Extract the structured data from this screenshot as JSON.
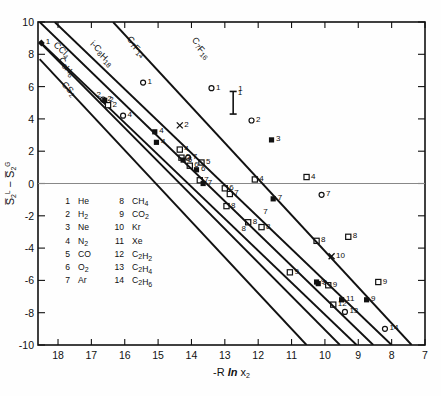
{
  "chart_data": {
    "type": "line",
    "title": "",
    "xlabel": "-R ln x₂",
    "ylabel": "S̅₂ᴸ - S̅₂ᴳ",
    "xlim": [
      18.6,
      7.0
    ],
    "ylim": [
      -10,
      10
    ],
    "x_ticks": [
      18,
      17,
      16,
      15,
      14,
      13,
      12,
      11,
      10,
      9,
      8,
      7
    ],
    "y_ticks": [
      10,
      8,
      6,
      4,
      2,
      0,
      -2,
      -4,
      -6,
      -8,
      -10
    ],
    "grid": false,
    "legend_position": "inside-lower-left",
    "x_axis_reversed": true,
    "zero_line": true,
    "series": [
      {
        "name": "CS2",
        "label": "CS₂",
        "label_x": 17.9,
        "label_y": 6.1,
        "x_start": 18.55,
        "y_start": 7.7,
        "x_end": 10.55,
        "y_end": -10.0,
        "points": [
          {
            "id": "4",
            "x": 16.05,
            "y": 4.2,
            "marker": "open-circle"
          },
          {
            "id": "7",
            "x": 14.1,
            "y": 1.6,
            "marker": "open-circle"
          },
          {
            "id": "8",
            "x": 12.95,
            "y": -1.4,
            "marker": "open-square"
          },
          {
            "id": "9",
            "x": 11.05,
            "y": -5.5,
            "marker": "open-square"
          }
        ]
      },
      {
        "name": "C6H6",
        "label": "C₆H₆",
        "label_x": 18.0,
        "label_y": 7.6,
        "x_start": 18.55,
        "y_start": 8.75,
        "x_end": 9.55,
        "y_end": -10.0,
        "points": [
          {
            "id": "2",
            "x": 16.65,
            "y": 5.2,
            "marker": "open-circle"
          },
          {
            "id": "4",
            "x": 15.1,
            "y": 3.2,
            "marker": "filled-square"
          },
          {
            "id": "5",
            "x": 14.3,
            "y": 1.6,
            "marker": "open-square"
          },
          {
            "id": "6",
            "x": 14.05,
            "y": 1.1,
            "marker": "open-square"
          },
          {
            "id": "7",
            "x": 13.75,
            "y": 0.2,
            "marker": "open-square"
          },
          {
            "id": "8",
            "x": 12.3,
            "y": -2.4,
            "marker": "open-square"
          },
          {
            "id": "9",
            "x": 10.25,
            "y": -6.1,
            "marker": "filled-square"
          }
        ]
      },
      {
        "name": "CCl4",
        "label": "CCl₄",
        "label_x": 18.15,
        "label_y": 8.55,
        "x_start": 18.55,
        "y_start": 8.8,
        "x_end": 9.05,
        "y_end": -10.0,
        "points": [
          {
            "id": "1",
            "x": 18.5,
            "y": 8.7,
            "marker": "filled-diamond"
          },
          {
            "id": "2",
            "x": 16.6,
            "y": 5.15,
            "marker": "filled-square"
          },
          {
            "id": "4",
            "x": 15.05,
            "y": 2.55,
            "marker": "filled-square"
          },
          {
            "id": "5",
            "x": 14.25,
            "y": 1.45,
            "marker": "filled-square"
          },
          {
            "id": "6",
            "x": 13.85,
            "y": 0.85,
            "marker": "filled-square"
          },
          {
            "id": "7",
            "x": 13.65,
            "y": 0.0,
            "marker": "filled-square"
          },
          {
            "id": "9",
            "x": 10.2,
            "y": -6.2,
            "marker": "filled-square"
          },
          {
            "id": "11",
            "x": 9.5,
            "y": -7.2,
            "marker": "filled-square"
          },
          {
            "id": "12",
            "x": 9.75,
            "y": -7.5,
            "marker": "open-square"
          },
          {
            "id": "13",
            "x": 9.4,
            "y": -7.95,
            "marker": "open-circle"
          }
        ]
      },
      {
        "name": "i-C8H18",
        "label": "i-C₈H₁₈",
        "label_x": 17.05,
        "label_y": 8.6,
        "x_start": 18.55,
        "y_start": 10.0,
        "x_end": 8.55,
        "y_end": -10.0,
        "points": [
          {
            "id": "2",
            "x": 16.5,
            "y": 4.85,
            "marker": "open-square"
          },
          {
            "id": "4",
            "x": 14.35,
            "y": 2.1,
            "marker": "open-square"
          },
          {
            "id": "5",
            "x": 13.7,
            "y": 1.3,
            "marker": "open-square"
          },
          {
            "id": "6",
            "x": 13.0,
            "y": -0.3,
            "marker": "open-square"
          },
          {
            "id": "7",
            "x": 12.85,
            "y": -0.65,
            "marker": "open-square"
          },
          {
            "id": "8",
            "x": 11.9,
            "y": -2.7,
            "marker": "open-square"
          },
          {
            "id": "9",
            "x": 9.9,
            "y": -6.3,
            "marker": "open-square"
          },
          {
            "id": "14",
            "x": 8.2,
            "y": -9.0,
            "marker": "open-circle"
          }
        ]
      },
      {
        "name": "C7F14",
        "label": "C₇F₁₄",
        "label_x": 15.95,
        "label_y": 8.9,
        "x_start": 18.1,
        "y_start": 10.0,
        "x_end": 8.0,
        "y_end": -10.0,
        "points": [
          {
            "id": "1",
            "x": 15.45,
            "y": 6.25,
            "marker": "open-circle"
          },
          {
            "id": "2",
            "x": 14.35,
            "y": 3.6,
            "marker": "cross"
          },
          {
            "id": "4",
            "x": 12.1,
            "y": 0.25,
            "marker": "open-square"
          },
          {
            "id": "7",
            "x": 11.55,
            "y": -0.95,
            "marker": "filled-square"
          },
          {
            "id": "8",
            "x": 10.25,
            "y": -3.55,
            "marker": "open-square"
          },
          {
            "id": "10",
            "x": 9.8,
            "y": -4.5,
            "marker": "cross"
          },
          {
            "id": "9",
            "x": 8.75,
            "y": -7.2,
            "marker": "filled-square"
          }
        ]
      },
      {
        "name": "C7F16",
        "label": "C₇F₁₆",
        "label_x": 14.0,
        "label_y": 8.85,
        "x_start": 16.35,
        "y_start": 10.0,
        "x_end": 7.4,
        "y_end": -10.0,
        "points": [
          {
            "id": "1",
            "x": 13.4,
            "y": 5.9,
            "marker": "open-circle"
          },
          {
            "id": "2",
            "x": 12.2,
            "y": 3.9,
            "marker": "open-circle"
          },
          {
            "id": "3",
            "x": 11.6,
            "y": 2.7,
            "marker": "filled-square"
          },
          {
            "id": "4",
            "x": 10.55,
            "y": 0.4,
            "marker": "open-square"
          },
          {
            "id": "7",
            "x": 10.1,
            "y": -0.7,
            "marker": "open-circle"
          },
          {
            "id": "8",
            "x": 9.3,
            "y": -3.3,
            "marker": "open-square"
          },
          {
            "id": "9",
            "x": 8.4,
            "y": -6.1,
            "marker": "open-square"
          }
        ]
      }
    ],
    "error_bar": {
      "x": 12.75,
      "y_center": 5.0,
      "y_low": 4.3,
      "y_high": 5.7,
      "label": "1"
    },
    "floating_labels": [
      {
        "text": "1",
        "x": 12.6,
        "y": 5.75
      },
      {
        "text": "2",
        "x": 16.85,
        "y": 5.35
      },
      {
        "text": "7",
        "x": 11.85,
        "y": -1.9
      },
      {
        "text": "8",
        "x": 12.5,
        "y": -2.95
      }
    ]
  },
  "legend": {
    "entries": [
      {
        "num": "1",
        "species": "He",
        "num2": "8",
        "species2": "CH₄"
      },
      {
        "num": "2",
        "species": "H₂",
        "num2": "9",
        "species2": "CO₂"
      },
      {
        "num": "3",
        "species": "Ne",
        "num2": "10",
        "species2": "Kr"
      },
      {
        "num": "4",
        "species": "N₂",
        "num2": "11",
        "species2": "Xe"
      },
      {
        "num": "5",
        "species": "CO",
        "num2": "12",
        "species2": "C₂H₂"
      },
      {
        "num": "6",
        "species": "O₂",
        "num2": "13",
        "species2": "C₂H₄"
      },
      {
        "num": "7",
        "species": "Ar",
        "num2": "14",
        "species2": "C₂H₆"
      }
    ]
  },
  "colors": {
    "ink": "#111111",
    "paper": "#fefefe",
    "zero_line": "#888888"
  }
}
